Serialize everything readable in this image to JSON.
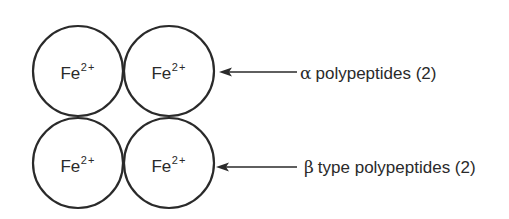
{
  "diagram": {
    "subunits": [
      {
        "id": "top-left",
        "ion": "Fe",
        "charge": "2+",
        "cx": 78,
        "cy": 71
      },
      {
        "id": "top-right",
        "ion": "Fe",
        "charge": "2+",
        "cx": 169,
        "cy": 71
      },
      {
        "id": "bottom-left",
        "ion": "Fe",
        "charge": "2+",
        "cx": 78,
        "cy": 163
      },
      {
        "id": "bottom-right",
        "ion": "Fe",
        "charge": "2+",
        "cx": 169,
        "cy": 163
      }
    ],
    "circle_radius": 45,
    "stroke_color": "#2a2a2a",
    "labels": {
      "alpha": {
        "symbol": "α",
        "text": "polypeptides (2)"
      },
      "beta": {
        "symbol": "β",
        "text": "type polypeptides (2)"
      }
    }
  }
}
